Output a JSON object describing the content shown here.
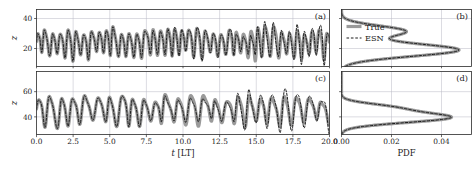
{
  "figure": {
    "background": "#ffffff",
    "axis_color": "#2b2b2b",
    "grid_color": "#b9b9c4"
  },
  "legend": {
    "position": "panel-b-upper-left",
    "entries": [
      {
        "label": "True",
        "style": "solid",
        "color": "#9a9a9a",
        "width": 3.2
      },
      {
        "label": "ESN",
        "style": "dashed",
        "color": "#1a1a1a",
        "width": 1.0
      }
    ]
  },
  "panels": {
    "a": {
      "label": "(a)"
    },
    "b": {
      "label": "(b)"
    },
    "c": {
      "label": "(c)"
    },
    "d": {
      "label": "(d)"
    }
  },
  "axis_text": {
    "time_label": "t [LT]",
    "time_label_italic": "t",
    "time_label_rest": " [LT]",
    "pdf_label": "PDF",
    "z_label": "z"
  },
  "chart_data": [
    {
      "id": "a",
      "type": "line",
      "title": "(a)",
      "xlabel": "t [LT]",
      "ylabel": "z",
      "xlim": [
        0.0,
        20.0
      ],
      "ylim": [
        8,
        46
      ],
      "xticks": [
        0.0,
        2.5,
        5.0,
        7.5,
        10.0,
        12.5,
        15.0,
        17.5,
        20.0
      ],
      "xticklabels": [
        "0.0",
        "2.5",
        "5.0",
        "7.5",
        "10.0",
        "12.5",
        "15.0",
        "17.5",
        "20.0"
      ],
      "yticks": [
        20,
        40
      ],
      "yticklabels": [
        "20",
        "40"
      ],
      "grid": true,
      "series": [
        {
          "name": "True",
          "style": "solid",
          "color": "#9a9a9a",
          "width": 3.2,
          "mean": 24.5,
          "amplitude": 9.0,
          "period": 0.52,
          "noise": 0.18,
          "seed": 11
        },
        {
          "name": "ESN",
          "style": "dashed",
          "color": "#1a1a1a",
          "width": 1.0,
          "mean": 24.5,
          "amplitude": 9.0,
          "period": 0.52,
          "noise": 0.18,
          "seed": 11,
          "divergence_start": 6.0,
          "divergence_gain": 0.55
        }
      ]
    },
    {
      "id": "b",
      "type": "line",
      "title": "(b)",
      "xlabel": "PDF",
      "ylabel": "z",
      "xlim": [
        0.0,
        0.052
      ],
      "ylim": [
        8,
        46
      ],
      "xticks": [
        0.0,
        0.02,
        0.04
      ],
      "xticklabels": [
        "0.00",
        "0.02",
        "0.04"
      ],
      "yticks": [
        20,
        40
      ],
      "grid": true,
      "distribution": {
        "orientation": "horizontal",
        "modes": [
          {
            "center": 19.0,
            "sigma": 4.2,
            "weight": 0.74
          },
          {
            "center": 31.5,
            "sigma": 3.6,
            "weight": 0.4
          }
        ],
        "peak_pdf": 0.047,
        "shoulder_pdf": 0.03
      },
      "series": [
        {
          "name": "True",
          "style": "solid",
          "color": "#9a9a9a",
          "width": 3.2
        },
        {
          "name": "ESN",
          "style": "dashed",
          "color": "#1a1a1a",
          "width": 1.0
        }
      ]
    },
    {
      "id": "c",
      "type": "line",
      "title": "(c)",
      "xlabel": "t [LT]",
      "ylabel": "z",
      "xlim": [
        0.0,
        20.0
      ],
      "ylim": [
        26,
        76
      ],
      "xticks": [
        0.0,
        2.5,
        5.0,
        7.5,
        10.0,
        12.5,
        15.0,
        17.5,
        20.0
      ],
      "xticklabels": [
        "0.0",
        "2.5",
        "5.0",
        "7.5",
        "10.0",
        "12.5",
        "15.0",
        "17.5",
        "20.0"
      ],
      "yticks": [
        40,
        60
      ],
      "yticklabels": [
        "40",
        "60"
      ],
      "grid": true,
      "series": [
        {
          "name": "True",
          "style": "solid",
          "color": "#9a9a9a",
          "width": 3.2,
          "mean": 46.0,
          "amplitude": 11.0,
          "period": 0.8,
          "noise": 0.2,
          "seed": 29
        },
        {
          "name": "ESN",
          "style": "dashed",
          "color": "#1a1a1a",
          "width": 1.0,
          "mean": 46.0,
          "amplitude": 11.0,
          "period": 0.8,
          "noise": 0.2,
          "seed": 29,
          "divergence_start": 5.5,
          "divergence_gain": 0.62
        }
      ]
    },
    {
      "id": "d",
      "type": "line",
      "title": "(d)",
      "xlabel": "PDF",
      "ylabel": "z",
      "xlim": [
        0.0,
        0.052
      ],
      "ylim": [
        26,
        76
      ],
      "xticks": [
        0.0,
        0.02,
        0.04
      ],
      "xticklabels": [
        "0.00",
        "0.02",
        "0.04"
      ],
      "yticks": [
        40,
        60
      ],
      "grid": true,
      "distribution": {
        "orientation": "horizontal",
        "modes": [
          {
            "center": 39.5,
            "sigma": 4.0,
            "weight": 0.86
          },
          {
            "center": 47.5,
            "sigma": 3.2,
            "weight": 0.34
          }
        ],
        "peak_pdf": 0.044,
        "shoulder_pdf": 0.027
      },
      "series": [
        {
          "name": "True",
          "style": "solid",
          "color": "#9a9a9a",
          "width": 3.2
        },
        {
          "name": "ESN",
          "style": "dashed",
          "color": "#1a1a1a",
          "width": 1.0
        }
      ]
    }
  ]
}
